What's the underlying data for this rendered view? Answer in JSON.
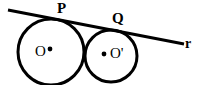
{
  "figure": {
    "kind": "geometry-diagram",
    "width": 204,
    "height": 85,
    "background_color": "#ffffff",
    "stroke_color": "#000000"
  },
  "labels": {
    "tangent_point_left": "P",
    "tangent_point_right": "Q",
    "line_name": "r",
    "center_left": "O",
    "center_right": "O'"
  },
  "chart_data": {
    "type": "scatter",
    "title": "",
    "xlabel": "",
    "ylabel": "",
    "grid": false,
    "legend": "none",
    "xlim": [
      0,
      204
    ],
    "ylim": [
      0,
      85
    ],
    "shapes": [
      {
        "name": "circle-left",
        "type": "circle",
        "cx": 51,
        "cy": 52,
        "r": 33,
        "stroke": "#000000",
        "stroke_width": 3,
        "fill": "none"
      },
      {
        "name": "circle-right",
        "type": "circle",
        "cx": 111,
        "cy": 56,
        "r": 26,
        "stroke": "#000000",
        "stroke_width": 3,
        "fill": "none"
      },
      {
        "name": "tangent-line-r",
        "type": "line",
        "x1": 8,
        "y1": 10,
        "x2": 184,
        "y2": 44,
        "stroke": "#000000",
        "stroke_width": 3
      },
      {
        "name": "center-dot-left",
        "type": "point",
        "cx": 50,
        "cy": 49,
        "r": 2.4,
        "fill": "#000000"
      },
      {
        "name": "center-dot-right",
        "type": "point",
        "cx": 104,
        "cy": 54,
        "r": 2.4,
        "fill": "#000000"
      }
    ],
    "annotations": [
      {
        "text": "P",
        "x": 62,
        "y": 8,
        "bold": true
      },
      {
        "text": "Q",
        "x": 117,
        "y": 18,
        "bold": true
      },
      {
        "text": "r",
        "x": 188,
        "y": 44,
        "bold": true
      },
      {
        "text": "O",
        "x": 41,
        "y": 52,
        "bold": false
      },
      {
        "text": "O'",
        "x": 116,
        "y": 54,
        "bold": false
      }
    ]
  }
}
